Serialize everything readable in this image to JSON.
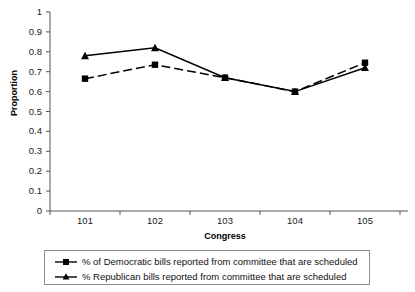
{
  "chart_data": {
    "type": "line",
    "title": "",
    "xlabel": "Congress",
    "ylabel": "Proportion",
    "categories": [
      "101",
      "102",
      "103",
      "104",
      "105"
    ],
    "ylim": [
      0,
      1
    ],
    "ytick_labels": [
      "1",
      "0.9",
      "0.8",
      "0.7",
      "0.6",
      "0.5",
      "0.4",
      "0.3",
      "0.2",
      "0.1",
      "0"
    ],
    "ytick_values": [
      1,
      0.9,
      0.8,
      0.7,
      0.6,
      0.5,
      0.4,
      0.3,
      0.2,
      0.1,
      0
    ],
    "grid": false,
    "legend_position": "bottom",
    "series": [
      {
        "name": "% of Democratic bills reported from committee that are scheduled",
        "marker": "square",
        "line_style": "dashed",
        "color": "#000000",
        "values": [
          0.665,
          0.735,
          0.67,
          0.6,
          0.745
        ]
      },
      {
        "name": "% Republican bills reported from committee that are scheduled",
        "marker": "triangle",
        "line_style": "solid",
        "color": "#000000",
        "values": [
          0.78,
          0.82,
          0.67,
          0.6,
          0.72
        ]
      }
    ]
  },
  "axes": {
    "y_label": "Proportion",
    "x_label": "Congress"
  },
  "legend": {
    "items": [
      {
        "label": "% of Democratic bills reported from committee that are scheduled",
        "marker": "square"
      },
      {
        "label": "% Republican bills reported from committee that are scheduled",
        "marker": "triangle"
      }
    ]
  }
}
